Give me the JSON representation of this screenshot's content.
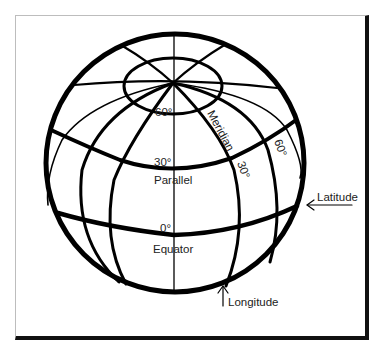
{
  "diagram": {
    "type": "globe-latitude-longitude",
    "labels": {
      "lat_60": "60°",
      "lat_30": "30°",
      "lat_0": "0°",
      "parallel": "Parallel",
      "equator": "Equator",
      "meridian": "Meridian",
      "lon_30": "30°",
      "lon_60": "60°",
      "latitude": "Latitude",
      "longitude": "Longitude"
    },
    "arrows": {
      "latitude_arrow": "←",
      "longitude_arrow": "↑"
    },
    "colors": {
      "line": "#000000",
      "text": "#222222",
      "background": "#ffffff"
    }
  }
}
